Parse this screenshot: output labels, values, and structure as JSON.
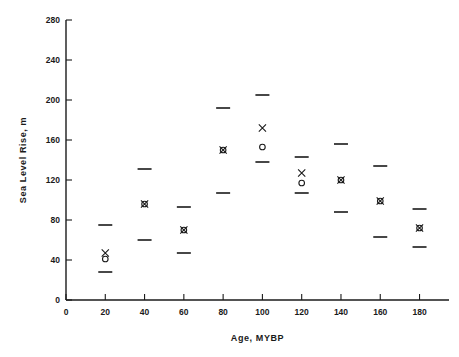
{
  "chart_data": {
    "type": "scatter",
    "title": "",
    "xlabel": "Age, MYBP",
    "ylabel": "Sea Level Rise, m",
    "xlim": [
      0,
      195
    ],
    "ylim": [
      0,
      280
    ],
    "xticks": [
      0,
      20,
      40,
      60,
      80,
      100,
      120,
      140,
      160,
      180
    ],
    "yticks": [
      0,
      40,
      80,
      120,
      160,
      200,
      240,
      280
    ],
    "grid": false,
    "legend": null,
    "x": [
      20,
      40,
      60,
      80,
      100,
      120,
      140,
      160,
      180
    ],
    "series": [
      {
        "name": "upper-bound",
        "marker": "dash",
        "values": [
          75,
          131,
          93,
          192,
          205,
          143,
          156,
          134,
          91
        ]
      },
      {
        "name": "estimate-x",
        "marker": "x",
        "values": [
          47,
          96,
          70,
          150,
          172,
          127,
          120,
          99,
          72
        ]
      },
      {
        "name": "estimate-o",
        "marker": "o",
        "values": [
          41,
          96,
          70,
          150,
          153,
          117,
          120,
          99,
          72
        ]
      },
      {
        "name": "lower-bound",
        "marker": "dash",
        "values": [
          28,
          60,
          47,
          107,
          138,
          107,
          88,
          63,
          53
        ]
      }
    ],
    "colors": {
      "axis": "#1a1a1a",
      "marker": "#1a1a1a",
      "background": "#ffffff"
    }
  }
}
